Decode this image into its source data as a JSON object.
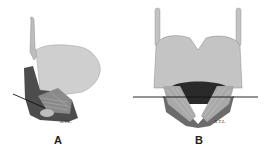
{
  "figure": {
    "panels": [
      {
        "id": "A",
        "label": "A",
        "signature": "R.T.L.",
        "view": "lateral"
      },
      {
        "id": "B",
        "label": "B",
        "signature": "R.T.L.",
        "view": "posterior"
      }
    ],
    "colors": {
      "cartilage": "#c9c9c9",
      "shadow": "#5a5a5a",
      "dark": "#2a2a2a",
      "line": "#111111"
    }
  }
}
